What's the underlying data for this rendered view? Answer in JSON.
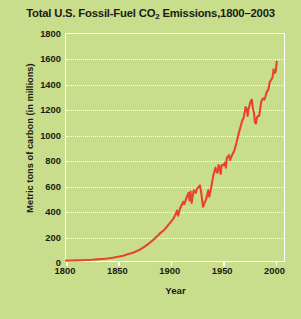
{
  "chart_data": {
    "type": "line",
    "title_main": "Total U.S. Fossil-Fuel CO",
    "title_sub": "2",
    "title_tail": " Emissions,1800–2003",
    "xlabel": "Year",
    "ylabel": "Metric tons of carbon (in millions)",
    "xlim": [
      1800,
      2010
    ],
    "ylim": [
      0,
      1800
    ],
    "xticks": [
      1800,
      1850,
      1900,
      1950,
      2000
    ],
    "yticks": [
      0,
      200,
      400,
      600,
      800,
      1000,
      1200,
      1400,
      1600,
      1800
    ],
    "grid": "horizontal-dotted-white",
    "legend": "none",
    "line_color": "#e8442a",
    "background_color": "#c9de8c",
    "axis_color": "#ffffff",
    "text_color": "#1b1b14",
    "series_name": "U.S. fossil-fuel CO2 emissions",
    "x": [
      1800,
      1805,
      1810,
      1815,
      1820,
      1825,
      1830,
      1835,
      1840,
      1845,
      1850,
      1855,
      1860,
      1863,
      1865,
      1870,
      1875,
      1880,
      1885,
      1890,
      1895,
      1900,
      1903,
      1905,
      1907,
      1908,
      1910,
      1913,
      1914,
      1916,
      1918,
      1919,
      1920,
      1921,
      1923,
      1925,
      1926,
      1929,
      1930,
      1931,
      1932,
      1933,
      1935,
      1937,
      1938,
      1940,
      1942,
      1944,
      1945,
      1946,
      1947,
      1948,
      1949,
      1950,
      1952,
      1953,
      1954,
      1955,
      1957,
      1958,
      1960,
      1962,
      1964,
      1966,
      1968,
      1970,
      1971,
      1973,
      1974,
      1975,
      1976,
      1977,
      1978,
      1979,
      1980,
      1981,
      1982,
      1983,
      1984,
      1985,
      1986,
      1987,
      1988,
      1989,
      1990,
      1991,
      1992,
      1993,
      1994,
      1995,
      1996,
      1997,
      1998,
      1999,
      2000,
      2001,
      2002,
      2003
    ],
    "y": [
      3,
      4,
      5,
      6,
      8,
      10,
      13,
      16,
      20,
      26,
      33,
      42,
      55,
      62,
      68,
      85,
      110,
      140,
      175,
      215,
      250,
      300,
      330,
      360,
      400,
      360,
      420,
      470,
      450,
      500,
      540,
      480,
      550,
      460,
      560,
      540,
      570,
      600,
      560,
      490,
      430,
      450,
      490,
      560,
      510,
      590,
      680,
      740,
      710,
      700,
      760,
      740,
      690,
      760,
      760,
      780,
      740,
      820,
      840,
      800,
      840,
      870,
      930,
      1000,
      1060,
      1120,
      1130,
      1220,
      1210,
      1150,
      1210,
      1240,
      1270,
      1280,
      1210,
      1180,
      1100,
      1090,
      1140,
      1150,
      1150,
      1200,
      1260,
      1280,
      1290,
      1280,
      1300,
      1330,
      1350,
      1360,
      1410,
      1430,
      1440,
      1460,
      1520,
      1490,
      1500,
      1580
    ]
  }
}
